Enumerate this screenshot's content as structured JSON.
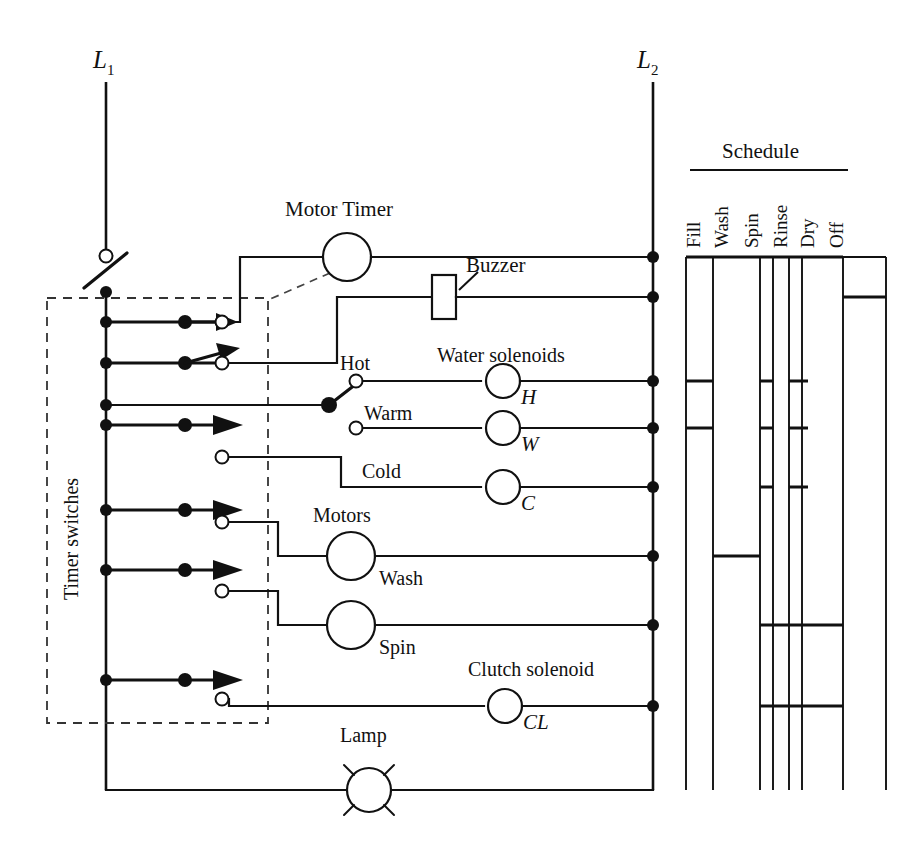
{
  "diagram": {
    "title_rails": {
      "l1": "L",
      "l1_sub": "1",
      "l2": "L",
      "l2_sub": "2"
    },
    "labels": {
      "timer_switches": "Timer switches",
      "motor_timer": "Motor Timer",
      "buzzer": "Buzzer",
      "water_solenoids": "Water solenoids",
      "hot": "Hot",
      "warm": "Warm",
      "cold": "Cold",
      "solenoid_h": "H",
      "solenoid_w": "W",
      "solenoid_c": "C",
      "motors": "Motors",
      "wash": "Wash",
      "spin": "Spin",
      "clutch_solenoid": "Clutch solenoid",
      "clutch_cl": "CL",
      "lamp": "Lamp"
    },
    "schedule": {
      "title": "Schedule",
      "columns": [
        "Fill",
        "Wash",
        "Spin",
        "Rinse",
        "Dry",
        "Off"
      ]
    },
    "colors": {
      "ink": "#111111",
      "paper": "#ffffff",
      "dashed": "#444444"
    }
  }
}
